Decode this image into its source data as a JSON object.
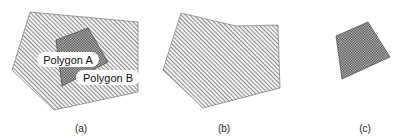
{
  "figure": {
    "panels": [
      {
        "id": "a",
        "caption": "(a)",
        "outer_polygon": "30,12 138,22 138,92 54,110 12,70",
        "inner_polygon": "56,40 88,28 108,62 62,86",
        "labels": [
          {
            "text": "Polygon A",
            "x": 37,
            "y": 52,
            "w": 62,
            "h": 15
          },
          {
            "text": "Polygon B",
            "x": 76,
            "y": 70,
            "w": 64,
            "h": 15
          }
        ]
      },
      {
        "id": "b",
        "caption": "(b)",
        "polygon": "181,13 236,26 278,25 280,88 203,108 163,70"
      },
      {
        "id": "c",
        "caption": "(c)",
        "polygon": "336,36 368,22 390,57 342,79"
      }
    ],
    "colors": {
      "hatch_line": "#555555",
      "crosshatch": "#333333",
      "label_bg": "#ffffff",
      "text": "#111111"
    }
  }
}
